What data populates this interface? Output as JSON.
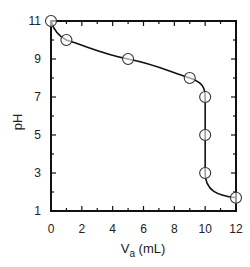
{
  "chart_data": {
    "type": "scatter",
    "title": "",
    "xlabel": "V_a (mL)",
    "xlabel_main": "V",
    "xlabel_sub": "a",
    "xlabel_unit": " (mL)",
    "ylabel": "pH",
    "xlim": [
      0,
      12
    ],
    "ylim": [
      1,
      11
    ],
    "grid": false,
    "legend": null,
    "x_ticks": [
      0,
      2,
      4,
      6,
      8,
      10,
      12
    ],
    "y_ticks": [
      1,
      3,
      5,
      7,
      9,
      11
    ],
    "series": [
      {
        "name": "titration curve",
        "marker": "open-circle",
        "line": "smooth",
        "x": [
          0,
          1,
          5,
          9,
          10,
          10,
          10,
          12
        ],
        "y": [
          11,
          10,
          9,
          8,
          7,
          5,
          3,
          1.7
        ]
      }
    ]
  },
  "colors": {
    "line": "#111111",
    "axis": "#111111",
    "marker_stroke": "#333333",
    "marker_fill": "#ffffff"
  }
}
